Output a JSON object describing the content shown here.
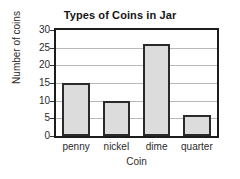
{
  "chart_data": {
    "type": "bar",
    "title": "Types of Coins in Jar",
    "xlabel": "Coin",
    "ylabel": "Number of coins",
    "categories": [
      "penny",
      "nickel",
      "dime",
      "quarter"
    ],
    "values": [
      15,
      10,
      26,
      6
    ],
    "ylim": [
      0,
      30
    ],
    "yticks": [
      0,
      5,
      10,
      15,
      20,
      25,
      30
    ],
    "ytick_labels": [
      "0",
      "5",
      "10",
      "15",
      "20",
      "25",
      "30"
    ],
    "grid": "horizontal",
    "legend": "none",
    "bar_fill_color": "#dcdcdc",
    "bar_edge_color": "#2a2a2a",
    "frame_color": "#1c1c1c",
    "gridline_color": "#b9b9b9",
    "background_color": "#ffffff"
  }
}
